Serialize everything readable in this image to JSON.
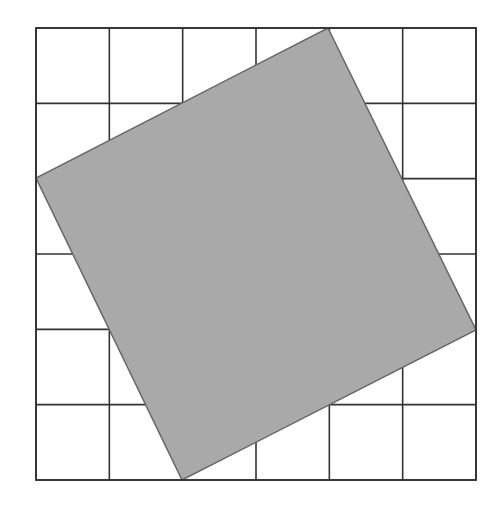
{
  "diagram": {
    "type": "pythagorean-tilted-square-on-grid",
    "grid": {
      "rows": 6,
      "cols": 6,
      "x0": 36,
      "y0": 28,
      "x1": 476,
      "y1": 480,
      "line_color": "#333333"
    },
    "tilted_square": {
      "vertices": [
        [
          328,
          28
        ],
        [
          476,
          330
        ],
        [
          182,
          480
        ],
        [
          36,
          178
        ]
      ],
      "fill": "#a9a9a9",
      "stroke": "#666666",
      "grid_vertex_coords": [
        [
          4,
          0
        ],
        [
          6,
          4.1
        ],
        [
          2,
          6
        ],
        [
          0,
          2
        ]
      ]
    },
    "background": "#ffffff"
  }
}
